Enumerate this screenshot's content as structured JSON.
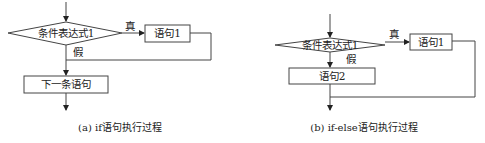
{
  "diagrams": [
    {
      "id": "a",
      "condition": "条件表达式1",
      "true_label": "真",
      "false_label": "假",
      "statement1": "语句1",
      "next_statement": "下一条语句",
      "caption": "(a) if语句执行过程"
    },
    {
      "id": "b",
      "condition": "条件表达式1",
      "true_label": "真",
      "false_label": "假",
      "statement1": "语句1",
      "statement2": "语句2",
      "caption": "(b) if-else语句执行过程"
    }
  ]
}
